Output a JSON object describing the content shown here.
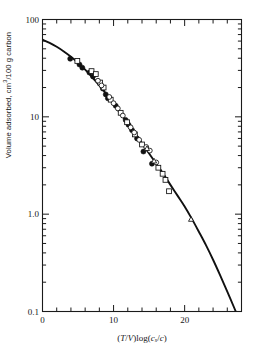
{
  "chart_data": {
    "type": "line",
    "title": "",
    "subtitle": "",
    "xlabel": "(T/V) log(c_s/c)",
    "ylabel": "Volume adsorbed, cm3/100 g carbon",
    "xlabel_parts": {
      "open": "(",
      "t": "T",
      "slash1": "/",
      "v": "V",
      "close": ")",
      "log": "log(",
      "c1": "c",
      "sub": "s",
      "slash2": "/",
      "c2": "c",
      "close2": ")"
    },
    "xscale": "linear",
    "yscale": "log",
    "xlim": [
      0,
      28
    ],
    "ylim": [
      0.1,
      100
    ],
    "grid": false,
    "legend": "none",
    "x_major_ticks": [
      0,
      10,
      20
    ],
    "x_major_tick_labels": [
      "0",
      "10",
      "20"
    ],
    "x_minor_tick_step": 2,
    "y_major_ticks": [
      0.1,
      1.0,
      10,
      100
    ],
    "y_major_tick_labels": [
      "0.1",
      "1.0",
      "10",
      "100"
    ],
    "y_minor_ticks": [
      0.2,
      0.3,
      0.4,
      0.5,
      0.6,
      0.7,
      0.8,
      0.9,
      2,
      3,
      4,
      5,
      6,
      7,
      8,
      9,
      20,
      30,
      40,
      50,
      60,
      70,
      80,
      90
    ],
    "ticks_direction": "in",
    "ticks_mirrored": true,
    "frame": "box",
    "line_color": "#111111",
    "marker_color": "#111111",
    "curve": {
      "name": "Characteristic curve",
      "x": [
        0,
        1,
        2,
        3,
        4,
        5,
        6,
        7,
        8,
        9,
        10,
        11,
        12,
        13,
        14,
        15,
        16,
        17,
        18,
        19,
        20,
        21,
        22,
        23,
        24,
        25,
        26,
        27,
        27.4
      ],
      "y": [
        62,
        57.5,
        52.5,
        47,
        41.5,
        36,
        30.5,
        25.5,
        21,
        17,
        13.5,
        10.8,
        8.6,
        6.8,
        5.35,
        4.2,
        3.3,
        2.6,
        2.0,
        1.55,
        1.2,
        0.9,
        0.66,
        0.48,
        0.34,
        0.235,
        0.16,
        0.108,
        0.092
      ]
    },
    "series": [
      {
        "name": "filled-circle",
        "marker": "filled-circle",
        "fill": "#111111",
        "points": [
          {
            "x": 3.9,
            "y": 39.5
          },
          {
            "x": 5.2,
            "y": 34.5
          },
          {
            "x": 5.6,
            "y": 32.0
          },
          {
            "x": 6.6,
            "y": 28.5
          },
          {
            "x": 7.1,
            "y": 26.0
          },
          {
            "x": 8.5,
            "y": 19.5
          },
          {
            "x": 8.9,
            "y": 17.0
          },
          {
            "x": 9.2,
            "y": 15.5
          },
          {
            "x": 10.3,
            "y": 13.0
          },
          {
            "x": 11.7,
            "y": 9.3
          },
          {
            "x": 12.1,
            "y": 8.3
          },
          {
            "x": 12.6,
            "y": 7.3
          },
          {
            "x": 13.3,
            "y": 6.0
          },
          {
            "x": 14.2,
            "y": 4.4
          },
          {
            "x": 15.4,
            "y": 3.3
          }
        ]
      },
      {
        "name": "open-square",
        "marker": "open-square",
        "fill": "#ffffff",
        "points": [
          {
            "x": 4.9,
            "y": 37.5
          },
          {
            "x": 6.9,
            "y": 29.5
          },
          {
            "x": 7.5,
            "y": 27.5
          },
          {
            "x": 8.1,
            "y": 22.5
          },
          {
            "x": 8.6,
            "y": 20.0
          },
          {
            "x": 9.6,
            "y": 15.0
          },
          {
            "x": 11.0,
            "y": 11.0
          },
          {
            "x": 11.9,
            "y": 8.8
          },
          {
            "x": 13.0,
            "y": 6.6
          },
          {
            "x": 14.0,
            "y": 5.2
          },
          {
            "x": 16.3,
            "y": 3.0
          },
          {
            "x": 16.9,
            "y": 2.6
          },
          {
            "x": 17.3,
            "y": 2.25
          },
          {
            "x": 17.8,
            "y": 1.72
          }
        ]
      },
      {
        "name": "open-circle",
        "marker": "open-circle",
        "fill": "#ffffff",
        "points": [
          {
            "x": 7.8,
            "y": 23.5
          },
          {
            "x": 8.3,
            "y": 21.0
          },
          {
            "x": 9.4,
            "y": 16.0
          },
          {
            "x": 10.0,
            "y": 13.8
          },
          {
            "x": 10.6,
            "y": 12.2
          },
          {
            "x": 11.3,
            "y": 10.3
          },
          {
            "x": 12.4,
            "y": 7.8
          },
          {
            "x": 12.9,
            "y": 6.9
          },
          {
            "x": 13.6,
            "y": 5.8
          },
          {
            "x": 14.6,
            "y": 4.9
          },
          {
            "x": 15.1,
            "y": 4.5
          },
          {
            "x": 16.0,
            "y": 3.4
          }
        ]
      },
      {
        "name": "open-triangle",
        "marker": "open-triangle",
        "fill": "#ffffff",
        "points": [
          {
            "x": 14.7,
            "y": 4.7
          },
          {
            "x": 15.7,
            "y": 3.5
          },
          {
            "x": 20.9,
            "y": 0.88
          }
        ]
      }
    ]
  }
}
